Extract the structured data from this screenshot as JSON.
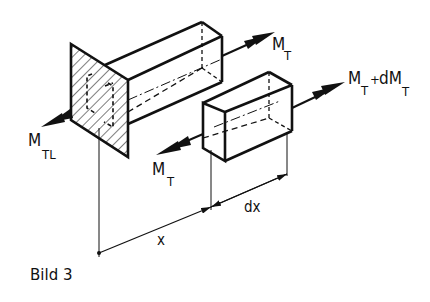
{
  "figure": {
    "caption": "Bild 3"
  },
  "labels": {
    "mt_upper": {
      "main": "M",
      "sub": "T"
    },
    "mt_plus_dmt": {
      "main1": "M",
      "sub1": "T",
      "plus": "+",
      "main2": "dM",
      "sub2": "T"
    },
    "mtl": {
      "main": "M",
      "sub": "TL"
    },
    "mt_lower": {
      "main": "M",
      "sub": "T"
    },
    "dim_x": "x",
    "dim_dx": "dx"
  },
  "colors": {
    "ink": "#111111",
    "paper": "#ffffff"
  }
}
